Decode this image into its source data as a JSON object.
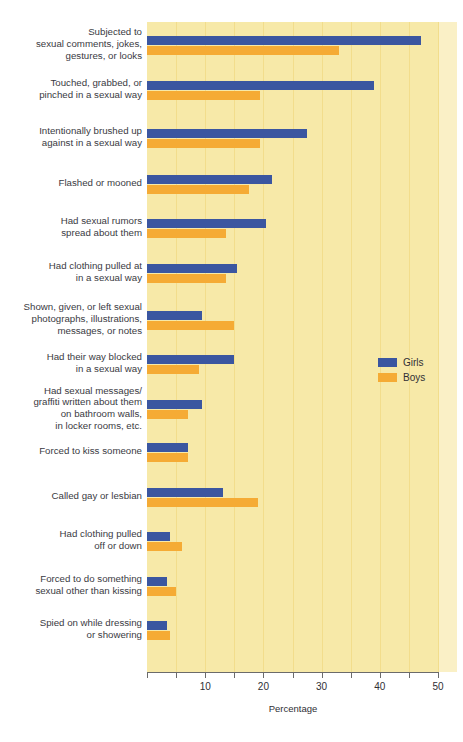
{
  "chart_data": {
    "type": "bar",
    "orientation": "horizontal",
    "title": "",
    "xlabel": "Percentage",
    "ylabel": "",
    "xlim": [
      0,
      50
    ],
    "xticks": [
      0,
      5,
      10,
      15,
      20,
      25,
      30,
      35,
      40,
      45,
      50
    ],
    "xtick_labels": [
      "",
      "",
      "10",
      "",
      "20",
      "",
      "30",
      "",
      "40",
      "",
      "50"
    ],
    "grid": true,
    "legend_position": "middle-right",
    "categories": [
      "Subjected to sexual comments, jokes, gestures, or looks",
      "Touched, grabbed, or pinched in a sexual way",
      "Intentionally brushed up against in a sexual way",
      "Flashed or mooned",
      "Had sexual rumors spread about them",
      "Had clothing pulled at in a sexual way",
      "Shown, given, or left sexual photographs, illustrations, messages, or notes",
      "Had their way blocked in a sexual way",
      "Had sexual messages/ graffiti written about them on bathroom walls, in locker rooms, etc.",
      "Forced to kiss someone",
      "Called gay or lesbian",
      "Had clothing pulled off or down",
      "Forced to do something sexual other than kissing",
      "Spied on while dressing or showering"
    ],
    "category_lines": [
      [
        "Subjected to",
        "sexual comments, jokes,",
        "gestures, or looks"
      ],
      [
        "Touched, grabbed, or",
        "pinched in a sexual way"
      ],
      [
        "Intentionally brushed up",
        "against in a sexual way"
      ],
      [
        "Flashed or mooned"
      ],
      [
        "Had sexual rumors",
        "spread about them"
      ],
      [
        "Had clothing pulled at",
        "in a sexual way"
      ],
      [
        "Shown, given, or left sexual",
        "photographs, illustrations,",
        "messages, or notes"
      ],
      [
        "Had their way blocked",
        "in a sexual way"
      ],
      [
        "Had sexual messages/",
        "graffiti written about them",
        "on bathroom walls,",
        "in locker rooms, etc."
      ],
      [
        "Forced to kiss someone"
      ],
      [
        "Called gay or lesbian"
      ],
      [
        "Had clothing pulled",
        "off or down"
      ],
      [
        "Forced to do something",
        "sexual other than kissing"
      ],
      [
        "Spied on while dressing",
        "or showering"
      ]
    ],
    "series": [
      {
        "name": "Girls",
        "color": "#3b56a0",
        "values": [
          47,
          39,
          27.5,
          21.5,
          20.5,
          15.5,
          9.5,
          15,
          9.5,
          7,
          13,
          4,
          3.5,
          3.5
        ]
      },
      {
        "name": "Boys",
        "color": "#f5ab35",
        "values": [
          33,
          19.5,
          19.5,
          17.5,
          13.5,
          13.5,
          15,
          9,
          7,
          7,
          19,
          6,
          5,
          4
        ]
      }
    ]
  },
  "legend": {
    "items": [
      {
        "label": "Girls",
        "color": "#3b56a0"
      },
      {
        "label": "Boys",
        "color": "#f5ab35"
      }
    ]
  },
  "axis": {
    "title": "Percentage",
    "tick_labels": [
      "10",
      "20",
      "30",
      "40",
      "50"
    ],
    "tick_values": [
      10,
      20,
      30,
      40,
      50
    ]
  },
  "colors": {
    "plot_background": "#f7e9a8",
    "plot_background_edge": "#faf0c6",
    "gridline": "#f2dd8c",
    "girls": "#3b56a0",
    "boys": "#f5ab35",
    "text": "#2f2f35",
    "axis": "#6b6b6b"
  }
}
